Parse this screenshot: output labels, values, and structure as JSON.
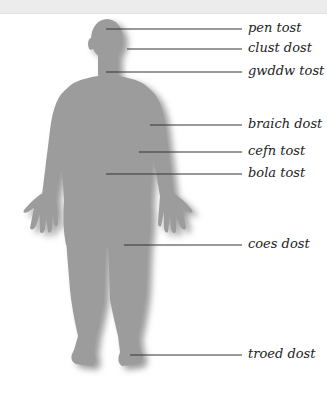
{
  "diagram": {
    "title": "",
    "colors": {
      "figure": "#9c9c9c",
      "shadow": "#c9c9c9",
      "leader_line": "#333333",
      "label_text": "#222222",
      "top_band": "#ececec"
    },
    "labels": [
      {
        "id": "pen",
        "text": "pen tost",
        "y": 29,
        "line_x1": 106
      },
      {
        "id": "clust",
        "text": "clust dost",
        "y": 49,
        "line_x1": 127
      },
      {
        "id": "gwddw",
        "text": "gwddw tost",
        "y": 72,
        "line_x1": 106
      },
      {
        "id": "braich",
        "text": "braich dost",
        "y": 125,
        "line_x1": 150
      },
      {
        "id": "cefn",
        "text": "cefn tost",
        "y": 152,
        "line_x1": 139
      },
      {
        "id": "bola",
        "text": "bola tost",
        "y": 174,
        "line_x1": 106
      },
      {
        "id": "coes",
        "text": "coes dost",
        "y": 245,
        "line_x1": 124
      },
      {
        "id": "troed",
        "text": "troed dost",
        "y": 355,
        "line_x1": 130
      }
    ],
    "line_x2": 242,
    "label_x": 248
  }
}
